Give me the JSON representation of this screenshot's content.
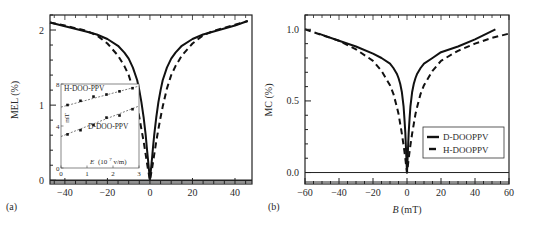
{
  "chart_data": [
    {
      "panel_label": "(a)",
      "type": "line",
      "title": "",
      "xlabel": "",
      "ylabel": "MEL (%)",
      "xlim": [
        -47,
        48
      ],
      "ylim": [
        -0.05,
        2.2
      ],
      "xticks": [
        -40,
        -20,
        0,
        20,
        40
      ],
      "yticks": [
        0,
        1,
        2
      ],
      "grid": false,
      "legend": null,
      "series": [
        {
          "name": "D-DOO-PPV",
          "style": "solid",
          "x": [
            -47,
            -40,
            -30,
            -25,
            -20,
            -15,
            -12,
            -10,
            -8,
            -6,
            -5,
            -4,
            -3,
            -2,
            -1.5,
            -1,
            -0.5,
            0,
            0.5,
            1,
            1.5,
            2,
            3,
            4,
            5,
            6,
            8,
            10,
            12,
            15,
            20,
            25,
            30,
            40,
            46
          ],
          "y": [
            2.1,
            2.05,
            1.98,
            1.94,
            1.88,
            1.79,
            1.7,
            1.62,
            1.5,
            1.33,
            1.2,
            1.04,
            0.84,
            0.6,
            0.45,
            0.3,
            0.15,
            0.0,
            0.15,
            0.3,
            0.45,
            0.6,
            0.84,
            1.04,
            1.2,
            1.33,
            1.5,
            1.62,
            1.7,
            1.79,
            1.88,
            1.94,
            1.98,
            2.06,
            2.12
          ]
        },
        {
          "name": "H-DOO-PPV",
          "style": "dashed",
          "x": [
            -47,
            -40,
            -30,
            -25,
            -20,
            -15,
            -12,
            -10,
            -8,
            -6,
            -5,
            -4,
            -3,
            -2,
            -1,
            -0.5,
            0,
            0.5,
            1,
            2,
            3,
            4,
            5,
            6,
            8,
            10,
            12,
            15,
            20,
            25,
            30,
            40,
            46
          ],
          "y": [
            2.1,
            2.06,
            1.99,
            1.93,
            1.82,
            1.66,
            1.52,
            1.4,
            1.22,
            0.98,
            0.84,
            0.68,
            0.52,
            0.34,
            0.16,
            0.08,
            0.0,
            0.08,
            0.16,
            0.34,
            0.52,
            0.68,
            0.84,
            0.98,
            1.22,
            1.4,
            1.52,
            1.66,
            1.82,
            1.93,
            1.99,
            2.07,
            2.12
          ]
        }
      ],
      "inset": {
        "type": "scatter",
        "xlabel": "E (10^7 v/m)",
        "xlabel_main": "E",
        "xlabel_unit": "(10",
        "xlabel_exp": "7",
        "xlabel_tail": " v/m)",
        "ylabel": "mT",
        "xlim": [
          0,
          3
        ],
        "ylim": [
          0,
          8
        ],
        "xticks": [
          0,
          1,
          2,
          3
        ],
        "yticks": [
          0,
          4,
          8
        ],
        "series": [
          {
            "name": "H-DOO-PPV",
            "x": [
              0.25,
              0.75,
              1.25,
              1.75,
              2.25,
              2.75
            ],
            "y": [
              6.0,
              6.4,
              6.8,
              7.0,
              7.3,
              7.6
            ],
            "fit": [
              [
                0.0,
                5.8
              ],
              [
                3.0,
                7.8
              ]
            ]
          },
          {
            "name": "D-DOO-PPV",
            "x": [
              0.25,
              0.75,
              1.25,
              1.75,
              2.25,
              2.75
            ],
            "y": [
              3.2,
              3.6,
              4.1,
              4.8,
              5.0,
              5.6
            ],
            "fit": [
              [
                0.0,
                3.0
              ],
              [
                3.0,
                5.9
              ]
            ]
          }
        ]
      }
    },
    {
      "panel_label": "(b)",
      "type": "line",
      "title": "",
      "xlabel": "B (mT)",
      "xlabel_var": "B",
      "xlabel_unit": " (mT)",
      "ylabel": "MC (%)",
      "xlim": [
        -60,
        60
      ],
      "ylim": [
        -0.08,
        1.1
      ],
      "xticks": [
        -60,
        -40,
        -20,
        0,
        20,
        40,
        60
      ],
      "ytick_labels": [
        "0.0",
        "0.5",
        "1.0"
      ],
      "yticks": [
        0.0,
        0.5,
        1.0
      ],
      "grid": false,
      "legend_position": "lower right",
      "series": [
        {
          "name": "D-DOOPPV",
          "style": "solid",
          "x": [
            -52,
            -40,
            -30,
            -20,
            -15,
            -10,
            -8,
            -6,
            -5,
            -4,
            -3,
            -2,
            -1.5,
            -1,
            -0.5,
            0,
            0.5,
            1,
            1.5,
            2,
            3,
            4,
            5,
            6,
            8,
            10,
            15,
            20,
            30,
            40,
            52
          ],
          "y": [
            0.97,
            0.92,
            0.88,
            0.83,
            0.8,
            0.76,
            0.73,
            0.69,
            0.66,
            0.62,
            0.56,
            0.46,
            0.38,
            0.28,
            0.15,
            0.0,
            0.15,
            0.28,
            0.38,
            0.46,
            0.56,
            0.62,
            0.66,
            0.69,
            0.73,
            0.76,
            0.8,
            0.84,
            0.88,
            0.93,
            1.0
          ]
        },
        {
          "name": "H-DOOPPV",
          "style": "dashed",
          "x": [
            -60,
            -50,
            -40,
            -30,
            -20,
            -15,
            -10,
            -8,
            -6,
            -5,
            -4,
            -3,
            -2,
            -1,
            -0.5,
            0,
            0.5,
            1,
            2,
            3,
            4,
            5,
            6,
            8,
            10,
            15,
            20,
            30,
            40,
            50,
            60
          ],
          "y": [
            1.0,
            0.96,
            0.92,
            0.86,
            0.78,
            0.71,
            0.61,
            0.55,
            0.46,
            0.41,
            0.34,
            0.27,
            0.19,
            0.1,
            0.05,
            0.0,
            0.05,
            0.1,
            0.19,
            0.27,
            0.34,
            0.41,
            0.46,
            0.55,
            0.61,
            0.71,
            0.78,
            0.85,
            0.9,
            0.94,
            0.97
          ]
        }
      ]
    }
  ]
}
